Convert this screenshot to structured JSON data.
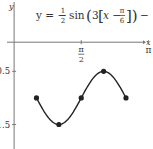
{
  "chart_data": {
    "type": "line",
    "title": "",
    "annotation": {
      "lhs": "y = −",
      "frac1_num": "1",
      "frac1_den": "2",
      "func": "sin",
      "open_paren": "(",
      "coef": "3",
      "open_bracket": "[",
      "var": "x −",
      "frac2_num": "π",
      "frac2_den": "6",
      "close": "])",
      "tail": "− 1"
    },
    "function": "y = -1/2 sin(3(x - pi/6)) - 1",
    "xlabel": "x",
    "ylabel": "y",
    "x_ticks": [
      {
        "value": 1.5707963,
        "num": "π",
        "den": "2"
      },
      {
        "value": 3.1415927,
        "label": "π"
      }
    ],
    "y_ticks": [
      {
        "value": -0.5,
        "label": "−0.5"
      },
      {
        "value": -1.5,
        "label": "−1.5"
      }
    ],
    "xlim": [
      -0.33,
      3.25
    ],
    "ylim": [
      -1.96,
      0.84
    ],
    "grid": false,
    "points": [
      {
        "x": 0.5235988,
        "y": -1.0
      },
      {
        "x": 1.0471976,
        "y": -1.5
      },
      {
        "x": 1.5707963,
        "y": -1.0
      },
      {
        "x": 2.0943951,
        "y": -0.5
      },
      {
        "x": 2.6179939,
        "y": -1.0
      }
    ],
    "curve_domain": [
      0.5235988,
      2.6179939
    ],
    "colors": {
      "axis": "#777777",
      "curve": "#222222",
      "text": "#333333"
    }
  }
}
